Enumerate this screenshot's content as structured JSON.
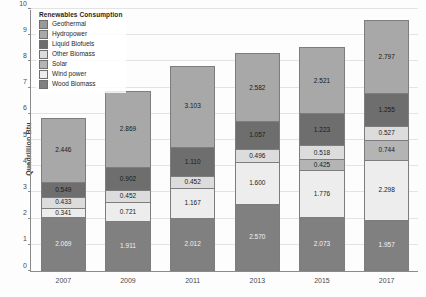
{
  "chart_data": {
    "type": "bar",
    "stacked": true,
    "title": "",
    "xlabel": "",
    "ylabel": "Quadrillion Btu",
    "ylim": [
      0,
      10
    ],
    "ytick_labels": [
      "0",
      "1",
      "2",
      "3",
      "4",
      "5",
      "6",
      "7",
      "8",
      "9",
      "10"
    ],
    "grid": true,
    "legend_position": "top-left",
    "legend_title": "Renewables Consumption",
    "categories": [
      "2007",
      "2009",
      "2011",
      "2013",
      "2015",
      "2017"
    ],
    "series": [
      {
        "name": "Wood Biomass",
        "color": "#808080",
        "label_light": true,
        "values": [
          2.069,
          1.911,
          2.012,
          2.57,
          2.073,
          1.957
        ]
      },
      {
        "name": "Wind power",
        "color": "#ededed",
        "label_light": false,
        "values": [
          0.341,
          0.721,
          1.167,
          1.6,
          1.776,
          2.298
        ]
      },
      {
        "name": "Solar",
        "color": "#b4b4b4",
        "label_light": false,
        "values": [
          0,
          0,
          0,
          0,
          0.425,
          0.744
        ]
      },
      {
        "name": "Other Biomass",
        "color": "#dcdcdc",
        "label_light": false,
        "values": [
          0.433,
          0.452,
          0.452,
          0.496,
          0.518,
          0.527
        ]
      },
      {
        "name": "Liquid Biofuels",
        "color": "#6e6e6e",
        "label_light": false,
        "values": [
          0.549,
          0.902,
          1.11,
          1.057,
          1.223,
          1.255
        ]
      },
      {
        "name": "Hydropower",
        "color": "#a8a8a8",
        "label_light": false,
        "values": [
          2.446,
          2.869,
          3.103,
          2.582,
          2.521,
          2.797
        ]
      },
      {
        "name": "Geothermal",
        "color": "#999999",
        "label_light": false,
        "values": [
          0,
          0,
          0,
          0,
          0,
          0
        ]
      }
    ],
    "legend_entries": [
      {
        "label": "Geothermal",
        "color": "#999999"
      },
      {
        "label": "Hydropower",
        "color": "#a8a8a8"
      },
      {
        "label": "Liquid Biofuels",
        "color": "#6e6e6e"
      },
      {
        "label": "Other Biomass",
        "color": "#dcdcdc"
      },
      {
        "label": "Solar",
        "color": "#b4b4b4"
      },
      {
        "label": "Wind power",
        "color": "#ededed"
      },
      {
        "label": "Wood Biomass",
        "color": "#808080"
      }
    ],
    "bar_labels": {
      "2007": [
        "2.069",
        "0.341",
        "",
        "0.433",
        "0.549",
        "2.446"
      ],
      "2009": [
        "1.911",
        "0.721",
        "",
        "0.452",
        "0.902",
        "2.869"
      ],
      "2011": [
        "2.012",
        "1.167",
        "",
        "0.452",
        "1.110",
        "3.103"
      ],
      "2013": [
        "2.570",
        "1.600",
        "",
        "0.496",
        "1.057",
        "2.582"
      ],
      "2015": [
        "2.073",
        "1.776",
        "0.425",
        "0.518",
        "1.223",
        "2.521"
      ],
      "2017": [
        "1.957",
        "2.298",
        "0.744",
        "0.527",
        "1.255",
        "2.797"
      ]
    }
  }
}
